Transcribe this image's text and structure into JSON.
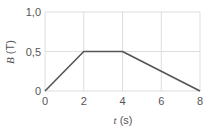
{
  "chart_data": {
    "type": "line",
    "title": "",
    "xlabel": "t (s)",
    "xlabel_var": "t",
    "xlabel_unit": "(s)",
    "ylabel": "B (T)",
    "ylabel_var": "B",
    "ylabel_unit": "(T)",
    "xlim": [
      0,
      8
    ],
    "ylim": [
      0,
      1.0
    ],
    "x_ticks": [
      "0",
      "2",
      "4",
      "6",
      "8"
    ],
    "y_ticks": [
      "0",
      "0,5",
      "1,0"
    ],
    "grid": true,
    "legend": null,
    "series": [
      {
        "name": "B(t)",
        "x": [
          0,
          2,
          4,
          8
        ],
        "y": [
          0,
          0.5,
          0.5,
          0
        ],
        "color": "#555555"
      }
    ]
  },
  "colors": {
    "grid": "#dddddd",
    "line": "#555555",
    "text": "#555555"
  }
}
